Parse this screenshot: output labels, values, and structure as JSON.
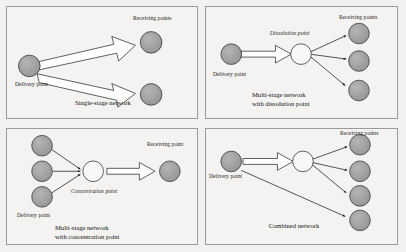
{
  "figure": {
    "background_color": "#f2f1ef",
    "panel_background": "#f4f3f1",
    "panel_border_color": "#9a9a9a",
    "node_fill_gray": "#9d9d9d",
    "node_fill_white": "#f8f8f6",
    "node_stroke": "#3a3a3a",
    "arrow_stroke": "#1a1a1a",
    "block_arrow_fill": "#ffffff"
  },
  "panels": {
    "single_stage": {
      "caption": "Single-stage network",
      "delivery_label": "Delivery point",
      "receiving_label": "Receiving points",
      "delivery_nodes": 1,
      "receiving_nodes": 2,
      "hub_nodes": 0,
      "connector_style": "block-arrow"
    },
    "dissolution": {
      "caption": "Multi-stage network\nwith dissolution point",
      "delivery_label": "Delivery point",
      "receiving_label": "Receiving points",
      "hub_label": "Dissolution point",
      "delivery_nodes": 1,
      "receiving_nodes": 3,
      "hub_nodes": 1,
      "connector_style": "block-arrow-then-lines"
    },
    "concentration": {
      "caption": "Multi-stage network\nwith concentration point",
      "delivery_label": "Delivery point",
      "receiving_label": "Receiving point",
      "hub_label": "Concentration point",
      "delivery_nodes": 3,
      "receiving_nodes": 1,
      "hub_nodes": 1,
      "connector_style": "lines-then-block-arrow"
    },
    "combined": {
      "caption": "Combined network",
      "delivery_label": "Delivery point",
      "receiving_label": "Receiving points",
      "delivery_nodes": 1,
      "receiving_nodes": 4,
      "hub_nodes": 1,
      "connector_style": "block-arrow-plus-lines-plus-direct"
    }
  }
}
